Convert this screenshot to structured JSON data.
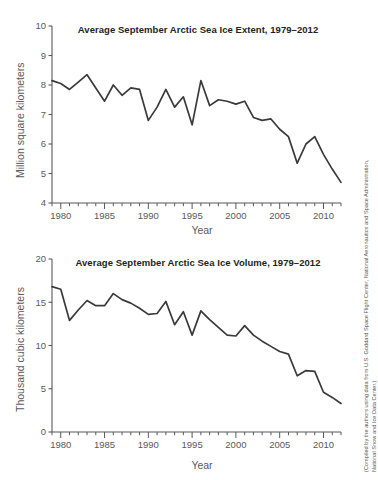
{
  "figure": {
    "credit_line_1": "(Compiled by the authors using data from U.S. Goddard Space Flight Center, National Aeronautics and Space Administration,",
    "credit_line_2": "National Snow and Ice Data Center.)"
  },
  "chart_data": [
    {
      "type": "line",
      "title": "Average September Arctic Sea Ice Extent, 1979–2012",
      "xlabel": "Year",
      "ylabel": "Million square kilometers",
      "xlim": [
        1979,
        2012
      ],
      "ylim": [
        4,
        10
      ],
      "yticks": [
        4,
        5,
        6,
        7,
        8,
        9,
        10
      ],
      "ytick_labels": [
        "4",
        "5",
        "6",
        "7",
        "8",
        "9",
        "10"
      ],
      "xticks": [
        1980,
        1985,
        1990,
        1995,
        2000,
        2005,
        2010
      ],
      "xtick_labels": [
        "1980",
        "1985",
        "1990",
        "1995",
        "2000",
        "2005",
        "2010"
      ],
      "minor_xticks_every": 1,
      "grid": false,
      "legend": false,
      "line_color": "#3a3a3a",
      "x": [
        1979,
        1980,
        1981,
        1982,
        1983,
        1984,
        1985,
        1986,
        1987,
        1988,
        1989,
        1990,
        1991,
        1992,
        1993,
        1994,
        1995,
        1996,
        1997,
        1998,
        1999,
        2000,
        2001,
        2002,
        2003,
        2004,
        2005,
        2006,
        2007,
        2008,
        2009,
        2010,
        2011,
        2012
      ],
      "values": [
        8.15,
        8.05,
        7.85,
        8.1,
        8.35,
        7.9,
        7.45,
        8.0,
        7.65,
        7.9,
        7.85,
        6.8,
        7.25,
        7.85,
        7.25,
        7.6,
        6.65,
        8.15,
        7.3,
        7.5,
        7.45,
        7.35,
        7.45,
        6.9,
        6.8,
        6.85,
        6.5,
        6.25,
        5.35,
        6.0,
        6.25,
        5.65,
        5.15,
        4.7
      ]
    },
    {
      "type": "line",
      "title": "Average September Arctic Sea Ice Volume, 1979–2012",
      "xlabel": "Year",
      "ylabel": "Thousand cubic kilometers",
      "xlim": [
        1979,
        2012
      ],
      "ylim": [
        0,
        20
      ],
      "yticks": [
        0,
        5,
        10,
        15,
        20
      ],
      "ytick_labels": [
        "0",
        "5",
        "10",
        "15",
        "20"
      ],
      "xticks": [
        1980,
        1985,
        1990,
        1995,
        2000,
        2005,
        2010
      ],
      "xtick_labels": [
        "1980",
        "1985",
        "1990",
        "1995",
        "2000",
        "2005",
        "2010"
      ],
      "minor_xticks_every": 1,
      "grid": false,
      "legend": false,
      "line_color": "#3a3a3a",
      "x": [
        1979,
        1980,
        1981,
        1982,
        1983,
        1984,
        1985,
        1986,
        1987,
        1988,
        1989,
        1990,
        1991,
        1992,
        1993,
        1994,
        1995,
        1996,
        1997,
        1998,
        1999,
        2000,
        2001,
        2002,
        2003,
        2004,
        2005,
        2006,
        2007,
        2008,
        2009,
        2010,
        2011,
        2012
      ],
      "values": [
        16.8,
        16.5,
        12.9,
        14.1,
        15.2,
        14.6,
        14.6,
        16.0,
        15.3,
        14.9,
        14.3,
        13.6,
        13.7,
        15.1,
        12.4,
        13.9,
        11.2,
        14.0,
        13.0,
        12.1,
        11.2,
        11.1,
        12.3,
        11.2,
        10.5,
        9.9,
        9.3,
        9.0,
        6.5,
        7.1,
        7.0,
        4.6,
        4.0,
        3.3
      ]
    }
  ]
}
